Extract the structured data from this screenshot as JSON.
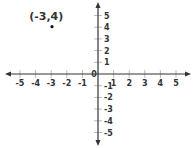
{
  "chart_data": {
    "type": "scatter",
    "title": "",
    "xlabel": "",
    "ylabel": "",
    "xlim": [
      -5,
      5
    ],
    "ylim": [
      -5,
      5
    ],
    "grid": false,
    "x_ticks": [
      -5,
      -4,
      -3,
      -2,
      -1,
      1,
      2,
      3,
      4,
      5
    ],
    "y_ticks": [
      5,
      4,
      3,
      2,
      1,
      -1,
      -2,
      -3,
      -4,
      -5
    ],
    "origin_label": "0",
    "points": [
      {
        "x": -3,
        "y": 4,
        "label": "(-3,4)"
      }
    ]
  },
  "colors": {
    "axis": "#333333",
    "tick": "#aaaaaa",
    "text": "#333333",
    "point": "#111111",
    "background": "#ffffff"
  }
}
